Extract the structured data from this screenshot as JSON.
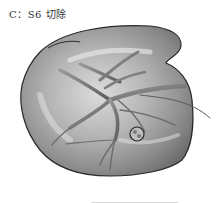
{
  "figure": {
    "caption": "C：S6 切除",
    "highlight": "tumor-in-segment-6",
    "colors": {
      "background": "#ffffff",
      "organ_light": "#d0d0d0",
      "organ_mid": "#a0a0a0",
      "organ_dark": "#6a6a6a",
      "vessel": "#7a7a7a",
      "outline": "#2a2a2a",
      "caption_text": "#333333"
    }
  }
}
